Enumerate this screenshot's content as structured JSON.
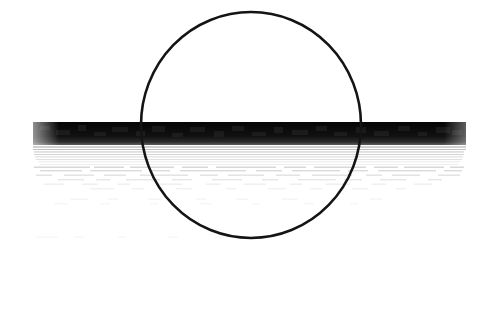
{
  "document": {
    "kind": "scanned-page-fragment",
    "description": "Degraded photocopy scan: hand-drawn circle overlapping an over-inked black text band",
    "width": 488,
    "height": 328,
    "background_color": "#ffffff",
    "ink_color": "#000000"
  },
  "annotation": {
    "shape": "circle",
    "label": "hand-drawn-circle-annotation",
    "center_x": 251,
    "center_y": 125,
    "radius_x": 110,
    "radius_y": 113,
    "stroke_color": "#141414",
    "stroke_width": 2.6,
    "fill": "none"
  },
  "redaction_band": {
    "label": "over-inked-text-band",
    "x": 33,
    "y": 122,
    "width": 433,
    "height": 23,
    "color": "#0a0a0a",
    "text_legible": false,
    "text_content": ""
  },
  "fade_lines": {
    "label": "fading-scan-lines",
    "color": "#8a8a8a",
    "rows": [
      {
        "y": 146.5,
        "x": 33,
        "width": 433,
        "thickness": 1.0,
        "opacity": 0.78
      },
      {
        "y": 149.0,
        "x": 33,
        "width": 433,
        "thickness": 0.9,
        "opacity": 0.62
      },
      {
        "y": 151.5,
        "x": 34,
        "width": 430,
        "thickness": 0.9,
        "opacity": 0.55
      },
      {
        "y": 154.0,
        "x": 34,
        "width": 430,
        "thickness": 0.8,
        "opacity": 0.46
      },
      {
        "y": 156.5,
        "x": 35,
        "width": 428,
        "thickness": 0.8,
        "opacity": 0.4
      },
      {
        "y": 159.0,
        "x": 36,
        "width": 426,
        "thickness": 0.8,
        "opacity": 0.33
      },
      {
        "y": 161.5,
        "x": 38,
        "width": 422,
        "thickness": 0.7,
        "opacity": 0.26
      },
      {
        "y": 164.0,
        "x": 40,
        "width": 418,
        "thickness": 0.7,
        "opacity": 0.2
      }
    ]
  },
  "ghost_text_rows": {
    "label": "illegible-ghost-text",
    "color": "#9a9a9a",
    "rows": [
      {
        "y": 166.5,
        "opacity": 0.42,
        "marks": [
          [
            34,
            56
          ],
          [
            94,
            30
          ],
          [
            130,
            44
          ],
          [
            182,
            26
          ],
          [
            216,
            60
          ],
          [
            284,
            22
          ],
          [
            314,
            52
          ],
          [
            374,
            24
          ],
          [
            404,
            40
          ],
          [
            450,
            14
          ]
        ]
      },
      {
        "y": 170.0,
        "opacity": 0.36,
        "marks": [
          [
            40,
            42
          ],
          [
            90,
            52
          ],
          [
            152,
            18
          ],
          [
            180,
            66
          ],
          [
            256,
            26
          ],
          [
            292,
            48
          ],
          [
            348,
            20
          ],
          [
            378,
            58
          ],
          [
            444,
            18
          ]
        ]
      },
      {
        "y": 174.5,
        "opacity": 0.3,
        "marks": [
          [
            36,
            16
          ],
          [
            64,
            30
          ],
          [
            104,
            22
          ],
          [
            140,
            48
          ],
          [
            200,
            18
          ],
          [
            228,
            36
          ],
          [
            276,
            24
          ],
          [
            312,
            40
          ],
          [
            366,
            16
          ],
          [
            392,
            28
          ],
          [
            438,
            22
          ]
        ]
      },
      {
        "y": 179.0,
        "opacity": 0.24,
        "marks": [
          [
            58,
            26
          ],
          [
            96,
            14
          ],
          [
            126,
            34
          ],
          [
            172,
            20
          ],
          [
            212,
            30
          ],
          [
            262,
            16
          ],
          [
            298,
            38
          ],
          [
            344,
            18
          ],
          [
            380,
            26
          ],
          [
            428,
            14
          ]
        ]
      },
      {
        "y": 183.5,
        "opacity": 0.18,
        "marks": [
          [
            44,
            20
          ],
          [
            82,
            16
          ],
          [
            118,
            12
          ],
          [
            156,
            26
          ],
          [
            206,
            14
          ],
          [
            244,
            22
          ],
          [
            290,
            12
          ],
          [
            326,
            24
          ],
          [
            372,
            14
          ],
          [
            414,
            18
          ]
        ]
      },
      {
        "y": 188.0,
        "opacity": 0.14,
        "marks": [
          [
            90,
            24
          ],
          [
            132,
            12
          ],
          [
            176,
            16
          ],
          [
            226,
            10
          ],
          [
            268,
            18
          ],
          [
            310,
            12
          ],
          [
            352,
            16
          ],
          [
            396,
            10
          ]
        ]
      },
      {
        "y": 198.5,
        "opacity": 0.12,
        "marks": [
          [
            70,
            18
          ],
          [
            108,
            10
          ],
          [
            148,
            14
          ],
          [
            196,
            10
          ],
          [
            236,
            12
          ],
          [
            282,
            16
          ],
          [
            330,
            10
          ],
          [
            370,
            12
          ]
        ]
      },
      {
        "y": 203.0,
        "opacity": 0.09,
        "marks": [
          [
            54,
            14
          ],
          [
            100,
            10
          ],
          [
            150,
            8
          ],
          [
            200,
            12
          ],
          [
            252,
            8
          ],
          [
            304,
            10
          ],
          [
            350,
            8
          ]
        ]
      },
      {
        "y": 236.5,
        "opacity": 0.08,
        "marks": [
          [
            36,
            22
          ],
          [
            74,
            10
          ],
          [
            118,
            8
          ],
          [
            168,
            10
          ],
          [
            214,
            8
          ]
        ]
      }
    ]
  },
  "band_mottling": {
    "label": "band-interior-mottling",
    "color": "#3b3b3b",
    "marks": [
      [
        40,
        126,
        10,
        4
      ],
      [
        56,
        130,
        14,
        5
      ],
      [
        78,
        125,
        8,
        6
      ],
      [
        94,
        132,
        12,
        4
      ],
      [
        112,
        127,
        16,
        5
      ],
      [
        136,
        131,
        9,
        5
      ],
      [
        152,
        126,
        13,
        6
      ],
      [
        172,
        133,
        11,
        4
      ],
      [
        190,
        127,
        15,
        5
      ],
      [
        214,
        131,
        10,
        6
      ],
      [
        232,
        126,
        12,
        5
      ],
      [
        252,
        132,
        14,
        4
      ],
      [
        274,
        127,
        9,
        6
      ],
      [
        292,
        130,
        16,
        5
      ],
      [
        316,
        126,
        11,
        5
      ],
      [
        334,
        132,
        13,
        4
      ],
      [
        356,
        127,
        10,
        6
      ],
      [
        374,
        131,
        15,
        5
      ],
      [
        398,
        126,
        12,
        5
      ],
      [
        418,
        132,
        9,
        4
      ],
      [
        436,
        127,
        14,
        6
      ],
      [
        452,
        130,
        10,
        5
      ]
    ]
  }
}
